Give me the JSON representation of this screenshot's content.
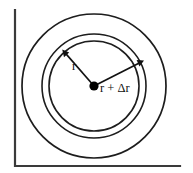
{
  "figure": {
    "type": "geometry-diagram",
    "labels": {
      "inner_radius": "r",
      "outer_radius": "r + Δr"
    },
    "colors": {
      "axis": "#3a3a3a",
      "circle_stroke": "#1d1d1d",
      "arrow": "#111111",
      "center_dot": "#000000",
      "background": "#ffffff"
    },
    "geometry": {
      "center": {
        "x": 94,
        "y": 86
      },
      "circles": [
        {
          "name": "inner-circle",
          "radius": 45
        },
        {
          "name": "middle-circle",
          "radius": 52
        },
        {
          "name": "outer-circle",
          "radius": 72
        }
      ],
      "axis": {
        "vertical_x": 15,
        "horizontal_y": 166,
        "top_y": 10,
        "right_x": 180
      },
      "arrows": [
        {
          "name": "r-arrow",
          "angle_deg": 132,
          "length": 45
        },
        {
          "name": "r-plus-delta-r-arrow",
          "angle_deg": 27,
          "length": 52
        }
      ]
    }
  }
}
